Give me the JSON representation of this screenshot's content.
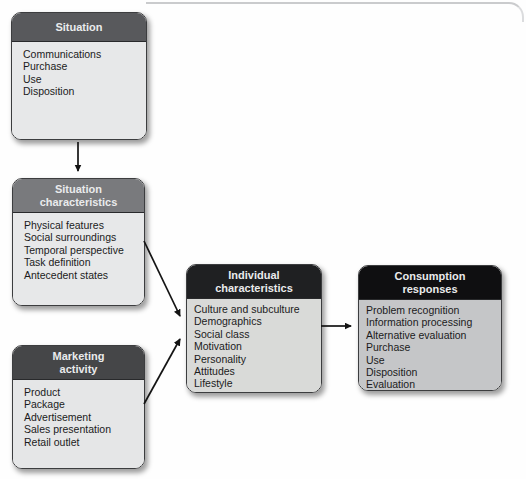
{
  "figure": {
    "background": "#ffffff",
    "frame_line_color": "#c2c3c5",
    "arrow_color": "#141414"
  },
  "boxes": [
    {
      "id": "situation",
      "title": "Situation",
      "items": [
        "Communications",
        "Purchase",
        "Use",
        "Disposition"
      ],
      "header_color": "#58595c",
      "body_color": "#e7e8e9",
      "header_text_color": "#eaebec"
    },
    {
      "id": "situation-characteristics",
      "title": "Situation\ncharacteristics",
      "items": [
        "Physical features",
        "Social surroundings",
        "Temporal perspective",
        "Task definition",
        "Antecedent states"
      ],
      "header_color": "#797a7d",
      "body_color": "#e7e8e9",
      "header_text_color": "#eaebec"
    },
    {
      "id": "marketing-activity",
      "title": "Marketing\nactivity",
      "items": [
        "Product",
        "Package",
        "Advertisement",
        "Sales presentation",
        "Retail outlet"
      ],
      "header_color": "#454648",
      "body_color": "#e5e6e7",
      "header_text_color": "#eaebec"
    },
    {
      "id": "individual-characteristics",
      "title": "Individual\ncharacteristics",
      "items": [
        "Culture and subculture",
        "Demographics",
        "Social class",
        "Motivation",
        "Personality",
        "Attitudes",
        "Lifestyle"
      ],
      "header_color": "#1f2022",
      "body_color": "#d9dad8",
      "header_text_color": "#eaebec"
    },
    {
      "id": "consumption-responses",
      "title": "Consumption\nresponses",
      "items": [
        "Problem recognition",
        "Information processing",
        "Alternative evaluation",
        "Purchase",
        "Use",
        "Disposition",
        "Evaluation"
      ],
      "header_color": "#0f0f11",
      "body_color": "#c5c6c8",
      "header_text_color": "#eaebec"
    }
  ],
  "connections": [
    {
      "from": "situation",
      "to": "situation-characteristics"
    },
    {
      "from": "situation-characteristics",
      "to": "individual-characteristics"
    },
    {
      "from": "marketing-activity",
      "to": "individual-characteristics"
    },
    {
      "from": "individual-characteristics",
      "to": "consumption-responses"
    }
  ]
}
